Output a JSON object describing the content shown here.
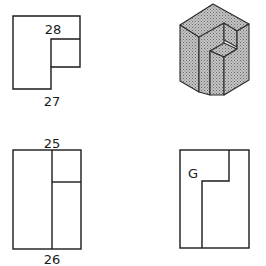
{
  "figures": {
    "top_view": {
      "label_inner": "28",
      "label_below": "27"
    },
    "isometric_view": {
      "description": "shaded isometric block with notch"
    },
    "front_view": {
      "label_above": "25",
      "label_below": "26"
    },
    "side_view": {
      "label_inner": "G"
    }
  },
  "colors": {
    "line": "#1a1a1a",
    "shade": "#b8b8b8",
    "background": "#ffffff"
  }
}
